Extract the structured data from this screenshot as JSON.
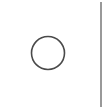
{
  "diagram": {
    "shapes": [
      {
        "type": "square-frame",
        "edges_visible": [
          "top",
          "right",
          "bottom"
        ],
        "stroke": "#7a7a7a"
      },
      {
        "type": "circle",
        "stroke": "#4a4a4a",
        "fill": "#ffffff"
      }
    ]
  }
}
